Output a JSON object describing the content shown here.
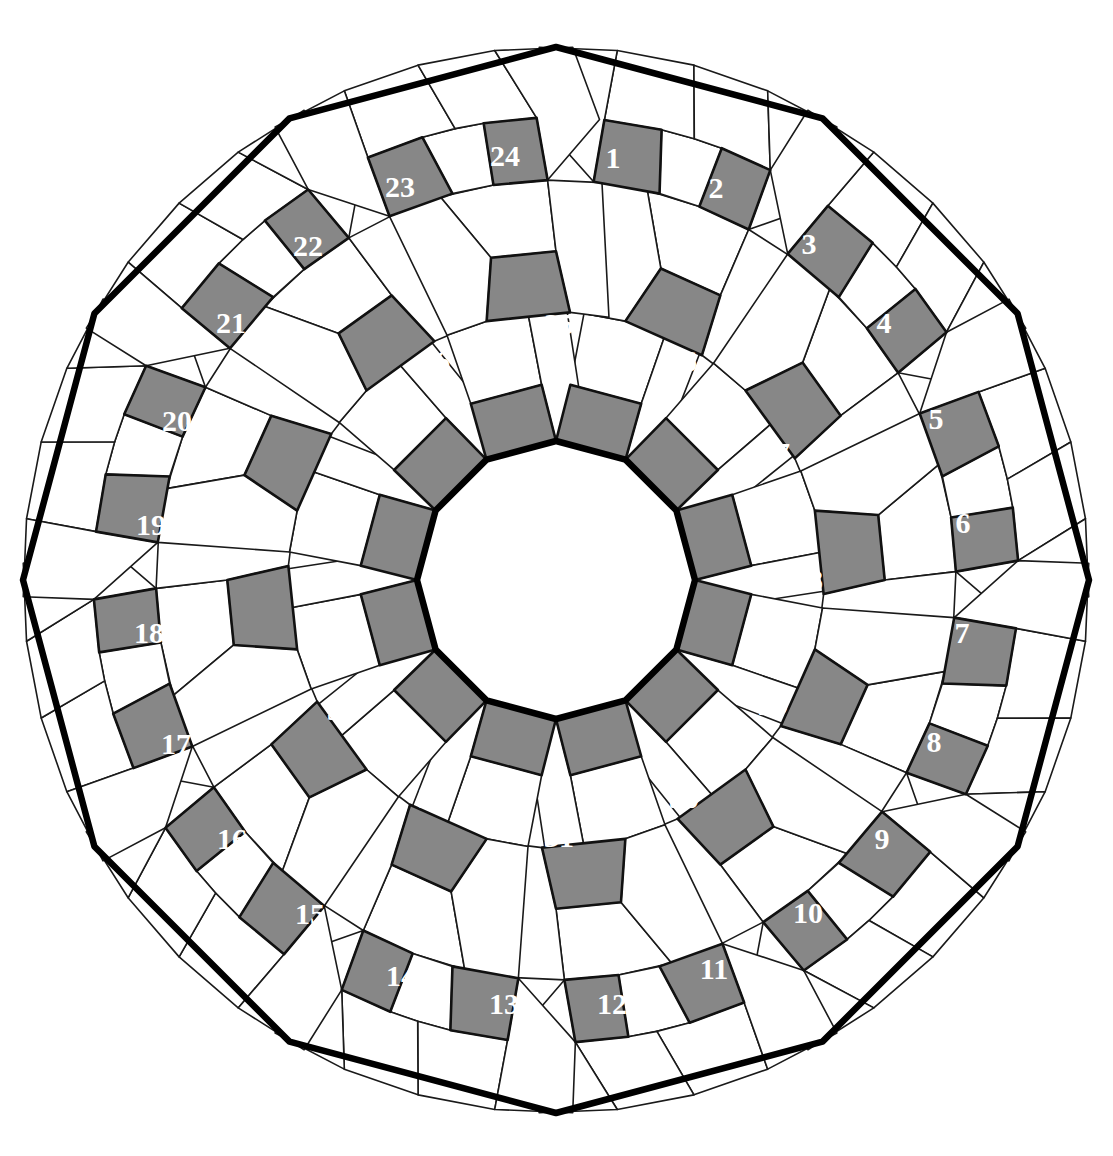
{
  "figure": {
    "name": "pentagonal-rosette-tiling",
    "symmetry_order": 12,
    "canvas": {
      "width": 1113,
      "height": 1156
    },
    "center": {
      "x": 556,
      "y": 580
    },
    "colors": {
      "background": "#ffffff",
      "tile_fill_plain": "#ffffff",
      "tile_fill_highlight": "#878787",
      "tile_stroke": "#1a1a1a",
      "tile_stroke_highlight": "#111111",
      "outline_stroke": "#000000",
      "label_text": "#ffffff"
    },
    "stroke_widths": {
      "tile": 1.6,
      "highlight_tile": 2.6,
      "outer_boundary": 6.5,
      "inner_boundary": 6.5
    },
    "inner_polygon": {
      "name": "central-dodecagon",
      "sides": 12,
      "radius": 139,
      "rotation_deg": 15
    },
    "outer_polygon": {
      "name": "outer-dodecagon-boundary",
      "sides": 12,
      "radius": 533,
      "rotation_deg": 15
    },
    "rings": [
      {
        "name": "inner-ring",
        "r_inner": 139,
        "r_outer": 268,
        "tiles_per_sector": 5
      },
      {
        "name": "middle-ring",
        "r_inner": 268,
        "r_outer": 400,
        "tiles_per_sector": 5
      },
      {
        "name": "outer-ring",
        "r_inner": 400,
        "r_outer": 533,
        "tiles_per_sector": 5
      }
    ]
  },
  "labels": {
    "outer_ring_numbers": [
      "1",
      "2",
      "3",
      "4",
      "5",
      "6",
      "7",
      "8",
      "9",
      "10",
      "11",
      "12"
    ],
    "middle_ring_numbers": [
      "13",
      "14",
      "15",
      "16",
      "17",
      "18",
      "19",
      "20",
      "21",
      "22",
      "23",
      "24"
    ],
    "inner_ring_numbers": [
      "25",
      "26",
      "27",
      "28",
      "29",
      "30",
      "31",
      "32",
      "33",
      "34",
      "35",
      "36"
    ],
    "all_numbers": [
      "1",
      "2",
      "3",
      "4",
      "5",
      "6",
      "7",
      "8",
      "9",
      "10",
      "11",
      "12",
      "13",
      "14",
      "15",
      "16",
      "17",
      "18",
      "19",
      "20",
      "21",
      "22",
      "23",
      "24",
      "25",
      "26",
      "27",
      "28",
      "29",
      "30",
      "31",
      "32",
      "33",
      "34",
      "35",
      "36"
    ]
  },
  "highlighted_tiles": [
    {
      "number": "1",
      "ring": "outer",
      "sector": 0,
      "x": 613,
      "y": 157
    },
    {
      "number": "2",
      "ring": "outer",
      "sector": 1,
      "x": 716,
      "y": 187
    },
    {
      "number": "3",
      "ring": "outer",
      "sector": 1,
      "x": 809,
      "y": 243
    },
    {
      "number": "4",
      "ring": "outer",
      "sector": 2,
      "x": 884,
      "y": 322
    },
    {
      "number": "5",
      "ring": "outer",
      "sector": 2,
      "x": 936,
      "y": 418
    },
    {
      "number": "6",
      "ring": "outer",
      "sector": 3,
      "x": 963,
      "y": 522
    },
    {
      "number": "7",
      "ring": "outer",
      "sector": 3,
      "x": 962,
      "y": 632
    },
    {
      "number": "8",
      "ring": "outer",
      "sector": 4,
      "x": 934,
      "y": 741
    },
    {
      "number": "9",
      "ring": "outer",
      "sector": 4,
      "x": 882,
      "y": 838
    },
    {
      "number": "10",
      "ring": "outer",
      "sector": 5,
      "x": 808,
      "y": 912
    },
    {
      "number": "11",
      "ring": "outer",
      "sector": 5,
      "x": 714,
      "y": 968
    },
    {
      "number": "12",
      "ring": "outer",
      "sector": 6,
      "x": 612,
      "y": 1003
    },
    {
      "number": "13",
      "ring": "outer",
      "sector": 6,
      "x": 504,
      "y": 1003
    },
    {
      "number": "14",
      "ring": "outer",
      "sector": 7,
      "x": 401,
      "y": 975
    },
    {
      "number": "15",
      "ring": "outer",
      "sector": 7,
      "x": 310,
      "y": 913
    },
    {
      "number": "16",
      "ring": "outer",
      "sector": 8,
      "x": 232,
      "y": 838
    },
    {
      "number": "17",
      "ring": "outer",
      "sector": 8,
      "x": 176,
      "y": 743
    },
    {
      "number": "18",
      "ring": "outer",
      "sector": 9,
      "x": 149,
      "y": 632
    },
    {
      "number": "19",
      "ring": "outer",
      "sector": 9,
      "x": 151,
      "y": 524
    },
    {
      "number": "20",
      "ring": "outer",
      "sector": 10,
      "x": 177,
      "y": 420
    },
    {
      "number": "21",
      "ring": "outer",
      "sector": 10,
      "x": 231,
      "y": 322
    },
    {
      "number": "22",
      "ring": "outer",
      "sector": 11,
      "x": 308,
      "y": 245
    },
    {
      "number": "23",
      "ring": "outer",
      "sector": 11,
      "x": 400,
      "y": 186
    },
    {
      "number": "24",
      "ring": "outer",
      "sector": 0,
      "x": 505,
      "y": 155
    },
    {
      "number": "25",
      "ring": "inner",
      "sector": 0,
      "x": 559,
      "y": 323
    },
    {
      "number": "26",
      "ring": "inner",
      "sector": 1,
      "x": 682,
      "y": 360
    },
    {
      "number": "27",
      "ring": "inner",
      "sector": 2,
      "x": 775,
      "y": 452
    },
    {
      "number": "28",
      "ring": "inner",
      "sector": 3,
      "x": 808,
      "y": 579
    },
    {
      "number": "29",
      "ring": "inner",
      "sector": 4,
      "x": 773,
      "y": 704
    },
    {
      "number": "30",
      "ring": "inner",
      "sector": 5,
      "x": 684,
      "y": 797
    },
    {
      "number": "31",
      "ring": "inner",
      "sector": 6,
      "x": 559,
      "y": 836
    },
    {
      "number": "32",
      "ring": "inner",
      "sector": 7,
      "x": 433,
      "y": 797
    },
    {
      "number": "33",
      "ring": "inner",
      "sector": 8,
      "x": 342,
      "y": 709
    },
    {
      "number": "34",
      "ring": "inner",
      "sector": 9,
      "x": 309,
      "y": 578
    },
    {
      "number": "35",
      "ring": "inner",
      "sector": 10,
      "x": 342,
      "y": 455
    },
    {
      "number": "36",
      "ring": "inner",
      "sector": 11,
      "x": 435,
      "y": 360
    }
  ]
}
